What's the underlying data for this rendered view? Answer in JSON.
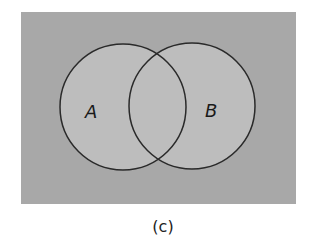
{
  "diagram": {
    "type": "venn",
    "universe_color": "#a8a8a8",
    "set_fill_color": "#bdbdbd",
    "stroke_color": "#2a2a2a",
    "sets": [
      {
        "label": "A"
      },
      {
        "label": "B"
      }
    ],
    "caption": "(c)"
  }
}
